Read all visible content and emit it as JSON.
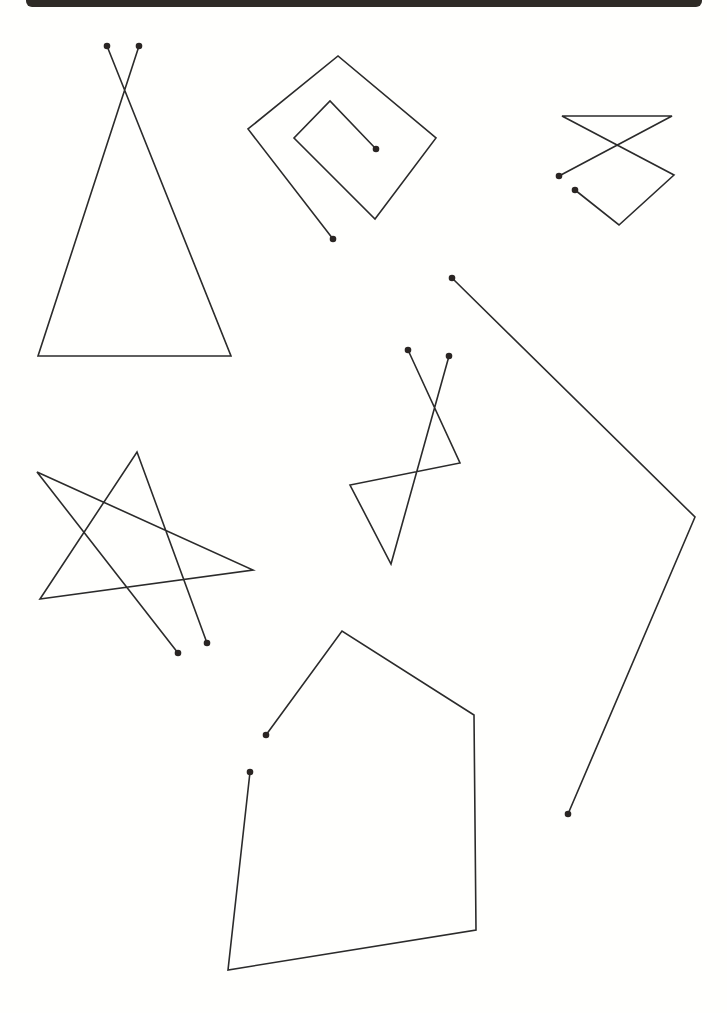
{
  "page": {
    "background": "#fffffd",
    "stroke_color": "#2b2b2b",
    "dot_color": "#2a2523",
    "top_bar_color": "#2f2b26"
  },
  "figures": [
    {
      "name": "triangle",
      "points": [
        [
          139,
          46
        ],
        [
          38,
          356
        ],
        [
          231,
          356
        ],
        [
          107,
          46
        ]
      ]
    },
    {
      "name": "square-spiral",
      "points": [
        [
          333,
          239
        ],
        [
          248,
          129
        ],
        [
          338,
          56
        ],
        [
          436,
          138
        ],
        [
          375,
          219
        ],
        [
          294,
          138
        ],
        [
          330,
          101
        ],
        [
          376,
          149
        ]
      ]
    },
    {
      "name": "hourglass",
      "points": [
        [
          559,
          176
        ],
        [
          672,
          116
        ],
        [
          562,
          116
        ],
        [
          674,
          175
        ],
        [
          619,
          225
        ],
        [
          575,
          190
        ]
      ]
    },
    {
      "name": "figure-eight",
      "points": [
        [
          408,
          350
        ],
        [
          460,
          463
        ],
        [
          350,
          485
        ],
        [
          391,
          564
        ],
        [
          449,
          356
        ]
      ]
    },
    {
      "name": "star",
      "points": [
        [
          178,
          653
        ],
        [
          37,
          472
        ],
        [
          253,
          570
        ],
        [
          40,
          599
        ],
        [
          137,
          452
        ],
        [
          207,
          643
        ]
      ]
    },
    {
      "name": "pentagon",
      "points": [
        [
          266,
          735
        ],
        [
          342,
          631
        ],
        [
          474,
          715
        ],
        [
          476,
          930
        ],
        [
          228,
          970
        ],
        [
          250,
          772
        ]
      ]
    },
    {
      "name": "angle-line",
      "points": [
        [
          452,
          278
        ],
        [
          695,
          517
        ],
        [
          568,
          814
        ]
      ]
    }
  ]
}
